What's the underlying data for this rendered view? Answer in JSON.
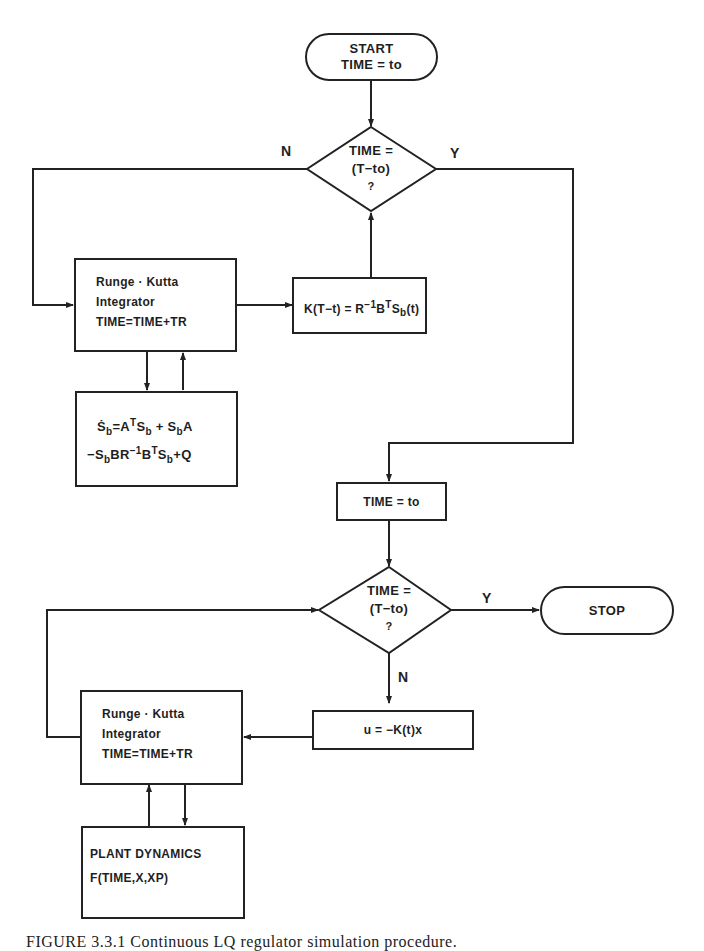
{
  "diagram": {
    "type": "flowchart",
    "nodes": {
      "start": {
        "line1": "START",
        "line2": "TIME = to"
      },
      "decision1": {
        "line1": "TIME =",
        "line2": "(T−to)",
        "line3": "?"
      },
      "rk1": {
        "line1": "Runge · Kutta",
        "line2": "Integrator",
        "line3": "TIME=TIME+TR"
      },
      "gain": {
        "text_main": "K(T−t) = R",
        "sup1": "−1",
        "text_b": "B",
        "sup2": "T",
        "text_s": "S",
        "sub1": "b",
        "text_end": "(t)"
      },
      "riccati": {
        "line1": {
          "s": "Ṡ",
          "sub1": "b",
          "eq": "=A",
          "supT": "T",
          "s2": "S",
          "sub2": "b",
          "plus": " + S",
          "sub3": "b",
          "end": "A"
        },
        "line2": {
          "start": "−S",
          "sub1": "b",
          "br": "BR",
          "sup1": "−1",
          "b": "B",
          "supT": "T",
          "s": "S",
          "sub2": "b",
          "end": "+Q"
        }
      },
      "reset_time": {
        "text": "TIME = to"
      },
      "decision2": {
        "line1": "TIME =",
        "line2": "(T−to)",
        "line3": "?"
      },
      "stop": {
        "text": "STOP"
      },
      "control": {
        "text": "u = −K(t)x"
      },
      "rk2": {
        "line1": "Runge · Kutta",
        "line2": "Integrator",
        "line3": "TIME=TIME+TR"
      },
      "plant": {
        "line1": "PLANT DYNAMICS",
        "line2": "F(TIME,X,XP)"
      }
    },
    "edge_labels": {
      "decision1_no": "N",
      "decision1_yes": "Y",
      "decision2_yes": "Y",
      "decision2_no": "N"
    },
    "edges": [
      {
        "from": "start",
        "to": "decision1"
      },
      {
        "from": "decision1",
        "to": "rk1",
        "label": "N"
      },
      {
        "from": "decision1",
        "to": "reset_time",
        "label": "Y"
      },
      {
        "from": "rk1",
        "to": "gain"
      },
      {
        "from": "gain",
        "to": "decision1"
      },
      {
        "from": "rk1",
        "to": "riccati"
      },
      {
        "from": "riccati",
        "to": "rk1"
      },
      {
        "from": "reset_time",
        "to": "decision2"
      },
      {
        "from": "decision2",
        "to": "stop",
        "label": "Y"
      },
      {
        "from": "decision2",
        "to": "control",
        "label": "N"
      },
      {
        "from": "control",
        "to": "rk2"
      },
      {
        "from": "rk2",
        "to": "decision2"
      },
      {
        "from": "rk2",
        "to": "plant"
      },
      {
        "from": "plant",
        "to": "rk2"
      }
    ]
  },
  "caption": "FIGURE 3.3.1   Continuous LQ regulator simulation procedure."
}
